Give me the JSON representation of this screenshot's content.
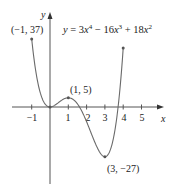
{
  "chart_data": {
    "type": "line",
    "equation": "y = 3x^4 - 16x^3 + 18x^2",
    "coefficients": {
      "x4": 3,
      "x3": -16,
      "x2": 18,
      "x1": 0,
      "x0": 0
    },
    "xlabel": "x",
    "ylabel": "y",
    "x_range": [
      -1,
      4
    ],
    "xlim": [
      -1.5,
      6
    ],
    "x_ticks": [
      -1,
      1,
      2,
      3,
      4,
      5
    ],
    "x_tick_labels": [
      "−1",
      "1",
      "2",
      "3",
      "4",
      "5"
    ],
    "grid": false,
    "labeled_points": [
      {
        "x": -1,
        "y": 37,
        "label": "(−1, 37)"
      },
      {
        "x": 1,
        "y": 5,
        "label": "(1, 5)"
      },
      {
        "x": 3,
        "y": -27,
        "label": "(3, −27)"
      }
    ],
    "series": [
      {
        "name": "y = 3x⁴ − 16x³ + 18x²",
        "x": [
          -1,
          -0.5,
          0,
          0.5,
          1,
          1.5,
          2,
          2.5,
          3,
          3.5,
          4
        ],
        "y": [
          37,
          6.69,
          0,
          2.69,
          5,
          0.19,
          -8,
          -18.28,
          -27,
          -20.81,
          32
        ]
      }
    ]
  },
  "labels": {
    "equation_y": "y",
    "equation_rest": " = 3x",
    "axis_x": "x",
    "axis_y": "y",
    "pt1": "(−1, 37)",
    "pt2": "(1, 5)",
    "pt3": "(3, −27)",
    "tick_m1": "−1",
    "tick_1": "1",
    "tick_2": "2",
    "tick_3": "3",
    "tick_4": "4",
    "tick_5": "5"
  }
}
